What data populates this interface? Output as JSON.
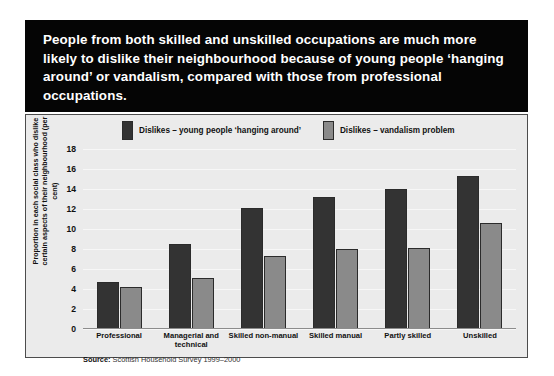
{
  "headline": "People from both skilled and unskilled occupations are much more likely to dislike their neighbourhood because of young people ‘hanging around’ or vandalism, compared with those from professional occupations.",
  "source_prefix": "Source:",
  "source_text": "Scottish Household Survey 1999–2000",
  "colors": {
    "series_dark": "#333333",
    "series_grey": "#8a8a8a",
    "banner": "#050505",
    "panel": "#ebebeb"
  },
  "chart_data": {
    "type": "bar",
    "title": "",
    "xlabel": "",
    "ylabel": "Proportion in each social class who dislike certain aspects of their neighbourhood (per cent)",
    "ylim": [
      0,
      18
    ],
    "yticks": [
      0,
      2,
      4,
      6,
      8,
      10,
      12,
      14,
      16,
      18
    ],
    "grid": true,
    "legend_position": "top",
    "categories": [
      "Professional",
      "Managerial and technical",
      "Skilled non-manual",
      "Skilled manual",
      "Partly skilled",
      "Unskilled"
    ],
    "series": [
      {
        "name": "Dislikes – young people ‘hanging around’",
        "color": "#333333",
        "values": [
          4.7,
          8.5,
          12.1,
          13.2,
          14.0,
          15.3
        ]
      },
      {
        "name": "Dislikes – vandalism problem",
        "color": "#8a8a8a",
        "values": [
          4.2,
          5.1,
          7.3,
          8.0,
          8.1,
          10.6
        ]
      }
    ]
  }
}
